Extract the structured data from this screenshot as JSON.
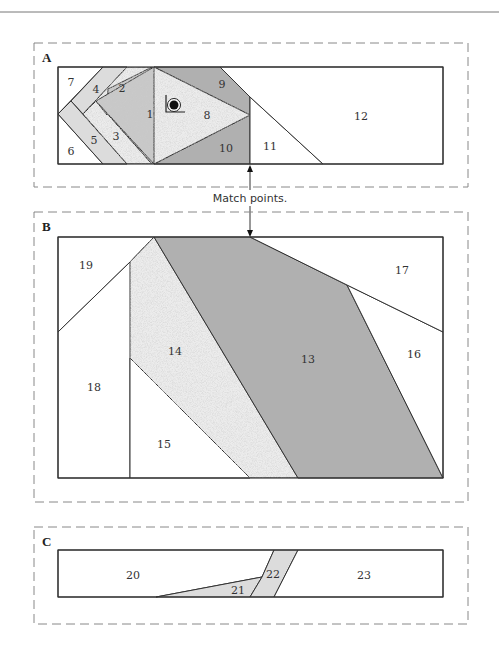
{
  "colors": {
    "white": "#ffffff",
    "light_gray": "#dcdcdc",
    "speckle_light": "#e8e8e8",
    "speckle_medium": "#c8c8c8",
    "dark_gray": "#b0b0b0",
    "line": "#333333",
    "dash": "#888888"
  },
  "sections": {
    "A": {
      "label": "A"
    },
    "B": {
      "label": "B"
    },
    "C": {
      "label": "C"
    }
  },
  "caption": "Match points.",
  "pieces": {
    "p1": "1",
    "p2": "2",
    "p3": "3",
    "p4": "4",
    "p5": "5",
    "p6": "6",
    "p7": "7",
    "p8": "8",
    "p9": "9",
    "p10": "10",
    "p11": "11",
    "p12": "12",
    "p13": "13",
    "p14": "14",
    "p15": "15",
    "p16": "16",
    "p17": "17",
    "p18": "18",
    "p19": "19",
    "p20": "20",
    "p21": "21",
    "p22": "22",
    "p23": "23"
  },
  "icons": {
    "target": "start-point-target-icon",
    "arrow": "match-point-arrow-icon"
  }
}
